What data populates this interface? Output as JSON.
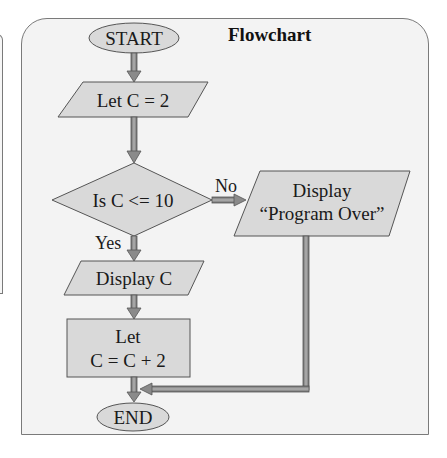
{
  "figure": {
    "title": "Flowchart"
  },
  "nodes": {
    "start": {
      "shape": "terminator",
      "label": "START"
    },
    "init": {
      "shape": "parallelogram",
      "label": "Let C = 2"
    },
    "decision": {
      "shape": "diamond",
      "label": "Is C <= 10"
    },
    "display_c": {
      "shape": "parallelogram",
      "label": "Display C"
    },
    "increment": {
      "shape": "rectangle",
      "line1": "Let",
      "line2": "C = C + 2"
    },
    "display_over": {
      "shape": "parallelogram",
      "line1": "Display",
      "line2": "“Program Over”"
    },
    "end": {
      "shape": "terminator",
      "label": "END"
    }
  },
  "edges": {
    "yes_label": "Yes",
    "no_label": "No"
  },
  "colors": {
    "shape_fill": "#d9d9d9",
    "shape_stroke": "#555555",
    "arrow_fill": "#8a8a8a",
    "frame_bg": "#f3f3f3",
    "frame_border": "#7a7a7a"
  }
}
